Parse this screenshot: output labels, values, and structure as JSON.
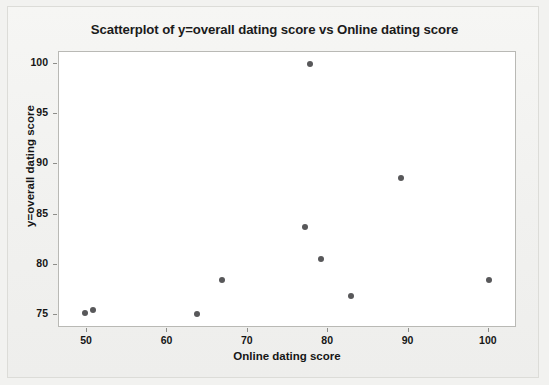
{
  "chart_data": {
    "type": "scatter",
    "title": "Scatterplot of y=overall dating score vs Online dating score",
    "xlabel": "Online dating score",
    "ylabel": "y=overall dating score",
    "xlim": [
      46.5,
      103.5
    ],
    "ylim": [
      73.7,
      101.2
    ],
    "xticks": [
      50,
      60,
      70,
      80,
      90,
      100
    ],
    "yticks": [
      75,
      80,
      85,
      90,
      95,
      100
    ],
    "grid": false,
    "legend": null,
    "marker_color": "#58585a",
    "points": [
      {
        "x": 49.9,
        "y": 75.1
      },
      {
        "x": 50.9,
        "y": 75.4
      },
      {
        "x": 63.8,
        "y": 75.0
      },
      {
        "x": 66.9,
        "y": 78.4
      },
      {
        "x": 77.3,
        "y": 83.7
      },
      {
        "x": 77.9,
        "y": 99.9
      },
      {
        "x": 79.2,
        "y": 80.5
      },
      {
        "x": 83.0,
        "y": 76.8
      },
      {
        "x": 89.2,
        "y": 88.5
      },
      {
        "x": 100.2,
        "y": 78.4
      }
    ]
  }
}
